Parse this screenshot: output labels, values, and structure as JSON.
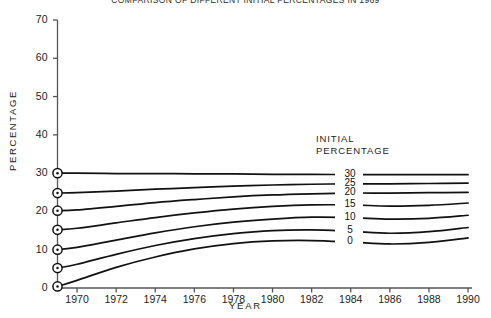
{
  "chart_data": {
    "type": "line",
    "title": "COMPARISON OF DIFFERENT INITIAL PERCENTAGES IN 1969",
    "xlabel": "YEAR",
    "ylabel": "PERCENTAGE",
    "xlim": [
      1969,
      1990
    ],
    "ylim": [
      0,
      70
    ],
    "grid": false,
    "legend_position": "inline-right",
    "legend_title_line1": "INITIAL",
    "legend_title_line2": "PERCENTAGE",
    "x_ticks": [
      1970,
      1972,
      1974,
      1976,
      1978,
      1980,
      1982,
      1984,
      1986,
      1988,
      1990
    ],
    "y_ticks": [
      0,
      10,
      20,
      30,
      40,
      50,
      60,
      70
    ],
    "x": [
      1969,
      1970,
      1972,
      1974,
      1976,
      1978,
      1980,
      1982,
      1984,
      1986,
      1988,
      1990
    ],
    "marker": "circle-dot-at-first-point",
    "series": [
      {
        "name": "30",
        "initial_percentage": 30,
        "values": [
          30.0,
          30.0,
          29.9,
          29.9,
          29.8,
          29.8,
          29.7,
          29.7,
          29.6,
          29.6,
          29.6,
          29.6
        ]
      },
      {
        "name": "25",
        "initial_percentage": 25,
        "values": [
          24.8,
          24.9,
          25.3,
          25.8,
          26.2,
          26.6,
          26.9,
          27.1,
          27.2,
          27.2,
          27.3,
          27.4
        ]
      },
      {
        "name": "20",
        "initial_percentage": 20,
        "values": [
          20.2,
          20.4,
          21.3,
          22.3,
          23.1,
          23.8,
          24.3,
          24.6,
          24.8,
          24.8,
          24.9,
          25.0
        ]
      },
      {
        "name": "15",
        "initial_percentage": 15,
        "values": [
          15.2,
          15.6,
          17.0,
          18.4,
          19.6,
          20.6,
          21.3,
          21.7,
          21.7,
          21.4,
          21.6,
          22.2
        ]
      },
      {
        "name": "10",
        "initial_percentage": 10,
        "values": [
          10.0,
          10.6,
          12.5,
          14.4,
          16.0,
          17.2,
          18.0,
          18.5,
          18.4,
          18.0,
          18.2,
          19.0
        ]
      },
      {
        "name": "5",
        "initial_percentage": 5,
        "values": [
          5.2,
          6.2,
          8.8,
          11.1,
          12.9,
          14.2,
          15.0,
          15.2,
          14.8,
          14.3,
          14.7,
          15.8
        ]
      },
      {
        "name": "0",
        "initial_percentage": 0,
        "values": [
          0.4,
          2.0,
          5.4,
          8.1,
          10.2,
          11.6,
          12.3,
          12.4,
          12.0,
          11.5,
          11.9,
          13.1
        ]
      }
    ]
  },
  "axis_title_x": "YEAR",
  "axis_title_y": "PERCENTAGE",
  "legend": {
    "line1": "INITIAL",
    "line2": "PERCENTAGE",
    "labels": [
      "30",
      "25",
      "20",
      "15",
      "10",
      "5",
      "0"
    ]
  },
  "style": {
    "line_color": "#111111",
    "axis_color": "#555555",
    "background": "#ffffff",
    "text_color": "#1c1c1c"
  }
}
